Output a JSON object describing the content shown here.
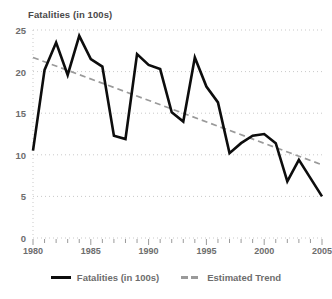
{
  "chart_data": {
    "type": "line",
    "title": "Fatalities (in 100s)",
    "xlabel": "",
    "ylabel": "",
    "xlim": [
      1980,
      2005
    ],
    "ylim": [
      0,
      25
    ],
    "grid": true,
    "legend_position": "bottom",
    "x": [
      1980,
      1981,
      1982,
      1983,
      1984,
      1985,
      1986,
      1987,
      1988,
      1989,
      1990,
      1991,
      1992,
      1993,
      1994,
      1995,
      1996,
      1997,
      1998,
      1999,
      2000,
      2001,
      2002,
      2003,
      2004,
      2005
    ],
    "xticks": [
      1980,
      1985,
      1990,
      1995,
      2000,
      2005
    ],
    "xtick_labels": [
      "1980",
      "1985",
      "1990",
      "1995",
      "2000",
      "2005"
    ],
    "yticks": [
      0,
      5,
      10,
      15,
      20,
      25
    ],
    "ytick_labels": [
      "0",
      "5",
      "10",
      "15",
      "20",
      "25"
    ],
    "series": [
      {
        "name": "Fatalities (in 100s)",
        "style": "solid",
        "color": "#0d0d0d",
        "values": [
          10.5,
          20.2,
          23.5,
          19.6,
          24.3,
          21.5,
          20.6,
          12.3,
          11.9,
          22.1,
          20.8,
          20.3,
          15.1,
          14.0,
          21.7,
          18.2,
          16.3,
          10.2,
          11.4,
          12.3,
          12.5,
          11.4,
          6.8,
          9.4,
          7.2,
          5.0
        ]
      },
      {
        "name": "Estimated Trend",
        "style": "dashed",
        "color": "#9a9a9a",
        "endpoints": [
          {
            "x": 1980,
            "y": 21.7
          },
          {
            "x": 2005,
            "y": 8.8
          }
        ]
      }
    ]
  },
  "legend": {
    "items": [
      {
        "label": "Fatalities (in 100s)",
        "swatch": "solid-line-swatch"
      },
      {
        "label": "Estimated Trend",
        "swatch": "dashed-line-swatch"
      }
    ]
  }
}
